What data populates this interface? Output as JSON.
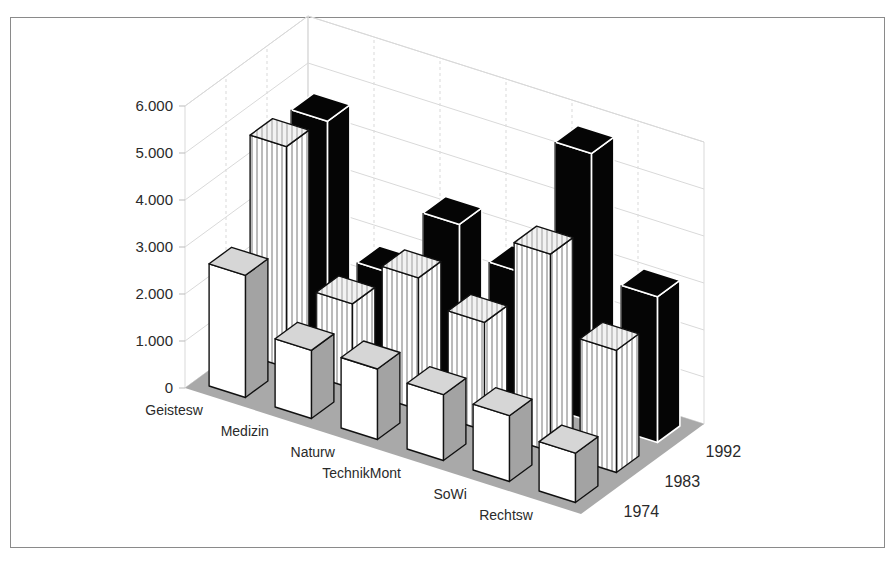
{
  "chart_data": {
    "type": "bar",
    "subtype": "3d-grouped-bar",
    "title": "",
    "xlabel": "",
    "ylabel": "",
    "categories": [
      "Geistesw",
      "Medizin",
      "Naturw",
      "TechnikMont",
      "SoWi",
      "Rechtsw"
    ],
    "series": [
      {
        "name": "1974",
        "style": "white-gray",
        "values": [
          2600,
          1450,
          1500,
          1400,
          1400,
          1050
        ]
      },
      {
        "name": "1983",
        "style": "striped",
        "values": [
          4700,
          1800,
          2800,
          2300,
          4200,
          2600
        ]
      },
      {
        "name": "1992",
        "style": "black",
        "values": [
          4600,
          1800,
          3300,
          2700,
          5700,
          3100
        ]
      }
    ],
    "yticks": [
      "0",
      "1.000",
      "2.000",
      "3.000",
      "4.000",
      "5.000",
      "6.000"
    ],
    "ylim": [
      0,
      6000
    ],
    "grid": true,
    "legend": "series labels on depth axis (right)"
  },
  "colors": {
    "floor": "#a9a9a9",
    "grid": "#d9d9d9",
    "front_face": "#ffffff",
    "side_face": "#a3a3a3",
    "top_face": "#d6d6d6",
    "black_bar": "#050505",
    "edge": "#111111"
  }
}
